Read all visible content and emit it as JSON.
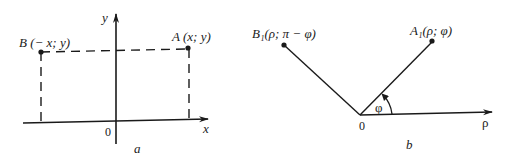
{
  "figure": {
    "panel_a": {
      "caption": "a",
      "x_axis_label": "x",
      "y_axis_label": "y",
      "origin_label": "0",
      "point_a_label": "A (x; y)",
      "point_b_label": "B (− x; y)"
    },
    "panel_b": {
      "caption": "b",
      "polar_axis_label": "ρ",
      "origin_label": "0",
      "angle_label": "φ",
      "point_a1_label": "A₁(ρ; φ)",
      "point_b1_label": "B₁(ρ; π − φ)"
    }
  },
  "colors": {
    "ink": "#1a1a1a",
    "background": "#ffffff"
  }
}
